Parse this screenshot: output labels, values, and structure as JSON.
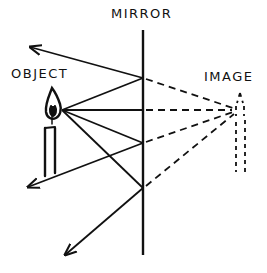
{
  "diagram": {
    "type": "plane-mirror-ray-diagram",
    "labels": {
      "mirror": "MIRROR",
      "object": "OBJECT",
      "image": "IMAGE"
    },
    "colors": {
      "ink": "#111111",
      "background": "#ffffff"
    },
    "mirror": {
      "x": 143,
      "y1": 30,
      "y2": 255
    },
    "object_point": {
      "x": 62,
      "y": 110
    },
    "image_point": {
      "x": 235,
      "y": 110
    },
    "incident_rays": [
      {
        "from": [
          62,
          110
        ],
        "to": [
          143,
          78
        ]
      },
      {
        "from": [
          62,
          110
        ],
        "to": [
          143,
          110
        ]
      },
      {
        "from": [
          62,
          110
        ],
        "to": [
          143,
          143
        ]
      },
      {
        "from": [
          62,
          110
        ],
        "to": [
          143,
          188
        ]
      }
    ],
    "reflected_rays": [
      {
        "from": [
          143,
          78
        ],
        "to": [
          30,
          47
        ],
        "arrow": true
      },
      {
        "from": [
          143,
          143
        ],
        "to": [
          28,
          187
        ],
        "arrow": true
      },
      {
        "from": [
          143,
          188
        ],
        "to": [
          65,
          255
        ],
        "arrow": true
      }
    ],
    "virtual_rays_dashed": [
      {
        "from": [
          143,
          78
        ],
        "to": [
          235,
          110
        ]
      },
      {
        "from": [
          143,
          110
        ],
        "to": [
          235,
          110
        ]
      },
      {
        "from": [
          143,
          143
        ],
        "to": [
          235,
          110
        ]
      },
      {
        "from": [
          143,
          188
        ],
        "to": [
          235,
          110
        ]
      }
    ]
  }
}
